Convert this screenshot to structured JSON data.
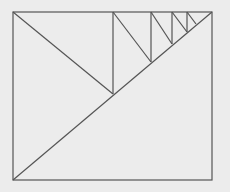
{
  "diagram": {
    "colors": {
      "background": "#ececec",
      "stroke": "#555555"
    },
    "stroke_width": 1.2,
    "rectangle": {
      "x": 13,
      "y": 12,
      "width": 199,
      "height": 168
    },
    "main_diagonal": {
      "x1": 13,
      "y1": 180,
      "x2": 212,
      "y2": 12
    },
    "segments": [
      {
        "x1": 13,
        "y1": 12,
        "x2": 113,
        "y2": 94
      },
      {
        "x1": 113,
        "y1": 94,
        "x2": 113,
        "y2": 12
      },
      {
        "x1": 113,
        "y1": 12,
        "x2": 151,
        "y2": 62
      },
      {
        "x1": 151,
        "y1": 62,
        "x2": 151,
        "y2": 12
      },
      {
        "x1": 151,
        "y1": 12,
        "x2": 172,
        "y2": 44
      },
      {
        "x1": 172,
        "y1": 44,
        "x2": 172,
        "y2": 12
      },
      {
        "x1": 172,
        "y1": 12,
        "x2": 187,
        "y2": 32
      },
      {
        "x1": 187,
        "y1": 32,
        "x2": 187,
        "y2": 12
      },
      {
        "x1": 187,
        "y1": 12,
        "x2": 196,
        "y2": 24
      }
    ]
  }
}
